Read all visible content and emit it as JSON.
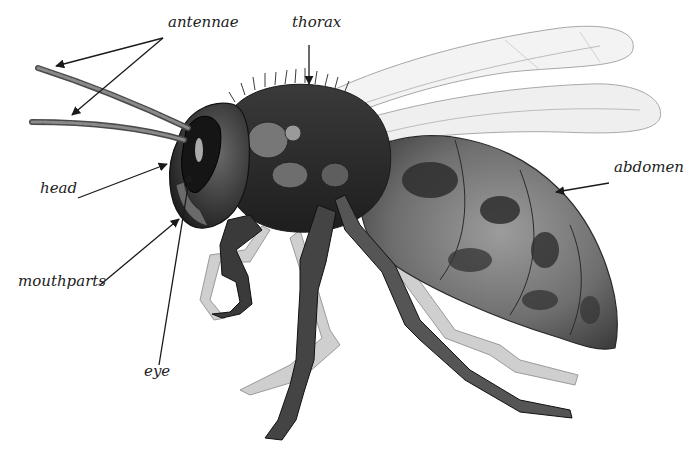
{
  "diagram": {
    "colors": {
      "background": "#ffffff",
      "label_text": "#222222",
      "arrow": "#1a1a1a",
      "body_dark": "#2b2b2b",
      "body_mid": "#6a6a6a",
      "body_light": "#a8a8a8",
      "wing_fill": "#f2f2f2",
      "wing_edge": "#9a9a9a"
    },
    "labels": [
      {
        "id": "antennae",
        "text": "antennae",
        "x": 168,
        "y": 27
      },
      {
        "id": "thorax",
        "text": "thorax",
        "x": 292,
        "y": 27
      },
      {
        "id": "head",
        "text": "head",
        "x": 40,
        "y": 193
      },
      {
        "id": "abdomen",
        "text": "abdomen",
        "x": 614,
        "y": 172
      },
      {
        "id": "mouthparts",
        "text": "mouthparts",
        "x": 18,
        "y": 286
      },
      {
        "id": "eye",
        "text": "eye",
        "x": 144,
        "y": 376
      }
    ],
    "arrows": [
      {
        "label": "antennae",
        "x1": 163,
        "y1": 38,
        "x2": 56,
        "y2": 66
      },
      {
        "label": "antennae",
        "x1": 163,
        "y1": 38,
        "x2": 72,
        "y2": 115
      },
      {
        "label": "thorax",
        "x1": 309,
        "y1": 45,
        "x2": 309,
        "y2": 84
      },
      {
        "label": "head",
        "x1": 78,
        "y1": 198,
        "x2": 167,
        "y2": 164
      },
      {
        "label": "abdomen",
        "x1": 609,
        "y1": 183,
        "x2": 556,
        "y2": 192
      },
      {
        "label": "mouthparts",
        "x1": 100,
        "y1": 285,
        "x2": 179,
        "y2": 219
      },
      {
        "label": "eye",
        "x1": 159,
        "y1": 365,
        "x2": 190,
        "y2": 174
      }
    ]
  }
}
